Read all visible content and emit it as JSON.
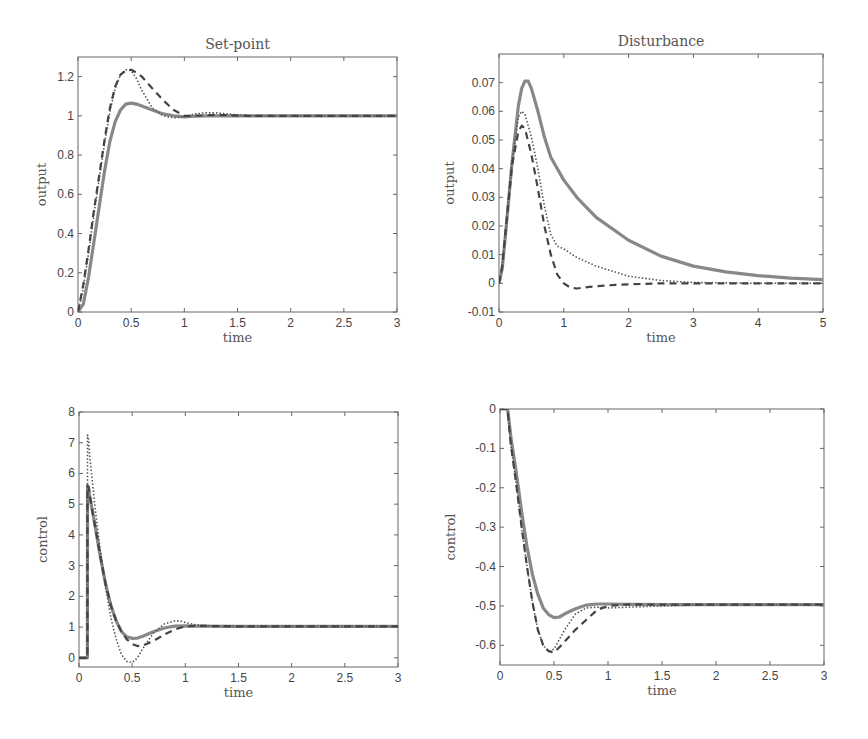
{
  "chart_data": [
    {
      "id": "setpoint-output",
      "type": "line",
      "title": "Set-point",
      "xlabel": "time",
      "ylabel": "output",
      "xlim": [
        0,
        3
      ],
      "ylim": [
        0,
        1.3
      ],
      "xticks": [
        0,
        0.5,
        1,
        1.5,
        2,
        2.5,
        3
      ],
      "xtick_labels": [
        "0",
        "0.5",
        "1",
        "1.5",
        "2",
        "2.5",
        "3"
      ],
      "yticks": [
        0,
        0.2,
        0.4,
        0.6,
        0.8,
        1.0,
        1.2
      ],
      "ytick_labels": [
        "0",
        "0.2",
        "0.4",
        "0.6",
        "0.8",
        "1",
        "1.2"
      ],
      "grid": false,
      "box": {
        "x": 78,
        "y": 57,
        "w": 319,
        "h": 255
      },
      "series": [
        {
          "name": "solid",
          "style": "solid",
          "x": [
            0,
            0.05,
            0.1,
            0.15,
            0.2,
            0.25,
            0.3,
            0.35,
            0.4,
            0.45,
            0.5,
            0.55,
            0.6,
            0.7,
            0.8,
            0.9,
            1.0,
            1.1,
            1.2,
            1.5,
            2,
            2.5,
            3
          ],
          "y": [
            0,
            0.04,
            0.18,
            0.36,
            0.54,
            0.72,
            0.87,
            0.97,
            1.03,
            1.06,
            1.065,
            1.06,
            1.05,
            1.03,
            1.01,
            1.0,
            0.995,
            0.998,
            1.0,
            1.0,
            1.0,
            1.0,
            1.0
          ]
        },
        {
          "name": "dotted",
          "style": "dotted",
          "x": [
            0,
            0.05,
            0.1,
            0.15,
            0.2,
            0.25,
            0.3,
            0.35,
            0.4,
            0.45,
            0.5,
            0.55,
            0.6,
            0.7,
            0.8,
            0.9,
            1.0,
            1.1,
            1.2,
            1.3,
            1.4,
            1.6,
            2,
            2.5,
            3
          ],
          "y": [
            0,
            0.12,
            0.3,
            0.5,
            0.68,
            0.86,
            1.02,
            1.14,
            1.21,
            1.235,
            1.23,
            1.19,
            1.13,
            1.04,
            1.0,
            0.99,
            0.995,
            1.01,
            1.015,
            1.015,
            1.01,
            1.0,
            1.0,
            1.0,
            1.0
          ]
        },
        {
          "name": "dashed",
          "style": "dashed",
          "x": [
            0,
            0.05,
            0.1,
            0.15,
            0.2,
            0.25,
            0.3,
            0.35,
            0.4,
            0.45,
            0.5,
            0.55,
            0.6,
            0.7,
            0.8,
            0.9,
            1.0,
            1.1,
            1.3,
            1.6,
            2,
            2.5,
            3
          ],
          "y": [
            0,
            0.14,
            0.32,
            0.52,
            0.7,
            0.88,
            1.04,
            1.15,
            1.21,
            1.23,
            1.235,
            1.22,
            1.2,
            1.14,
            1.08,
            1.03,
            1.0,
            1.0,
            1.005,
            1.0,
            1.0,
            1.0,
            1.0
          ]
        }
      ]
    },
    {
      "id": "disturbance-output",
      "type": "line",
      "title": "Disturbance",
      "xlabel": "time",
      "ylabel": "output",
      "xlim": [
        0,
        5
      ],
      "ylim": [
        -0.01,
        0.08
      ],
      "xticks": [
        0,
        1,
        2,
        3,
        4,
        5
      ],
      "xtick_labels": [
        "0",
        "1",
        "2",
        "3",
        "4",
        "5"
      ],
      "yticks": [
        -0.01,
        0,
        0.01,
        0.02,
        0.03,
        0.04,
        0.05,
        0.06,
        0.07
      ],
      "ytick_labels": [
        "-0.01",
        "0",
        "0.01",
        "0.02",
        "0.03",
        "0.04",
        "0.05",
        "0.06",
        "0.07"
      ],
      "grid": false,
      "box": {
        "x": 499,
        "y": 54,
        "w": 324,
        "h": 258
      },
      "series": [
        {
          "name": "solid",
          "style": "solid",
          "x": [
            0,
            0.05,
            0.1,
            0.2,
            0.3,
            0.35,
            0.4,
            0.45,
            0.5,
            0.6,
            0.7,
            0.8,
            1.0,
            1.2,
            1.5,
            2.0,
            2.5,
            3.0,
            3.5,
            4.0,
            4.5,
            5.0
          ],
          "y": [
            0,
            0.005,
            0.017,
            0.042,
            0.062,
            0.068,
            0.0705,
            0.0705,
            0.068,
            0.06,
            0.051,
            0.044,
            0.036,
            0.03,
            0.023,
            0.015,
            0.0095,
            0.006,
            0.004,
            0.0027,
            0.0018,
            0.0013
          ]
        },
        {
          "name": "dotted",
          "style": "dotted",
          "x": [
            0,
            0.05,
            0.1,
            0.2,
            0.3,
            0.35,
            0.4,
            0.5,
            0.6,
            0.7,
            0.8,
            0.9,
            1.0,
            1.2,
            1.5,
            2.0,
            2.5,
            3.0,
            4.0,
            5.0
          ],
          "y": [
            0,
            0.006,
            0.018,
            0.043,
            0.058,
            0.06,
            0.059,
            0.051,
            0.04,
            0.027,
            0.017,
            0.013,
            0.012,
            0.009,
            0.006,
            0.0025,
            0.001,
            0.0003,
            0.0,
            0.0
          ]
        },
        {
          "name": "dashed",
          "style": "dashed",
          "x": [
            0,
            0.05,
            0.1,
            0.2,
            0.3,
            0.35,
            0.4,
            0.5,
            0.6,
            0.7,
            0.8,
            0.9,
            1.0,
            1.1,
            1.2,
            1.4,
            1.8,
            2.5,
            3.5,
            5.0
          ],
          "y": [
            0,
            0.006,
            0.018,
            0.041,
            0.053,
            0.055,
            0.054,
            0.045,
            0.033,
            0.02,
            0.01,
            0.003,
            0.0,
            -0.0015,
            -0.0018,
            -0.0012,
            -0.0005,
            0.0,
            0.0,
            0.0
          ]
        }
      ]
    },
    {
      "id": "setpoint-control",
      "type": "line",
      "title": "",
      "xlabel": "time",
      "ylabel": "control",
      "xlim": [
        0,
        3
      ],
      "ylim": [
        -0.3,
        8
      ],
      "xticks": [
        0,
        0.5,
        1,
        1.5,
        2,
        2.5,
        3
      ],
      "xtick_labels": [
        "0",
        "0.5",
        "1",
        "1.5",
        "2",
        "2.5",
        "3"
      ],
      "yticks": [
        0,
        1,
        2,
        3,
        4,
        5,
        6,
        7,
        8
      ],
      "ytick_labels": [
        "0",
        "1",
        "2",
        "3",
        "4",
        "5",
        "6",
        "7",
        "8"
      ],
      "grid": false,
      "box": {
        "x": 79,
        "y": 412,
        "w": 319,
        "h": 255
      },
      "series": [
        {
          "name": "solid",
          "style": "solid",
          "x": [
            0,
            0.079,
            0.08,
            0.09,
            0.1,
            0.15,
            0.2,
            0.25,
            0.3,
            0.35,
            0.4,
            0.45,
            0.5,
            0.55,
            0.6,
            0.7,
            0.8,
            0.9,
            1.0,
            1.1,
            1.5,
            2,
            2.5,
            3
          ],
          "y": [
            0,
            0,
            5.6,
            5.55,
            5.3,
            4.3,
            3.3,
            2.4,
            1.7,
            1.2,
            0.85,
            0.68,
            0.63,
            0.64,
            0.7,
            0.85,
            0.97,
            1.03,
            1.04,
            1.03,
            1.02,
            1.02,
            1.02,
            1.02
          ]
        },
        {
          "name": "dotted",
          "style": "dotted",
          "x": [
            0,
            0.079,
            0.08,
            0.09,
            0.1,
            0.15,
            0.2,
            0.25,
            0.3,
            0.35,
            0.4,
            0.45,
            0.5,
            0.55,
            0.6,
            0.7,
            0.8,
            0.9,
            0.95,
            1.0,
            1.1,
            1.3,
            1.5,
            2,
            2.5,
            3
          ],
          "y": [
            0,
            0,
            7.25,
            7.1,
            6.6,
            4.9,
            3.5,
            2.3,
            1.3,
            0.6,
            0.1,
            -0.12,
            -0.15,
            0.0,
            0.3,
            0.8,
            1.1,
            1.2,
            1.2,
            1.15,
            1.07,
            1.02,
            1.02,
            1.02,
            1.02,
            1.02
          ]
        },
        {
          "name": "dashed",
          "style": "dashed",
          "x": [
            0,
            0.079,
            0.08,
            0.09,
            0.1,
            0.15,
            0.2,
            0.25,
            0.3,
            0.35,
            0.4,
            0.45,
            0.5,
            0.55,
            0.6,
            0.7,
            0.8,
            0.9,
            1.0,
            1.1,
            1.5,
            2,
            2.5,
            3
          ],
          "y": [
            0,
            0,
            5.6,
            5.55,
            5.3,
            4.3,
            3.3,
            2.4,
            1.7,
            1.2,
            0.85,
            0.6,
            0.45,
            0.38,
            0.4,
            0.55,
            0.75,
            0.92,
            1.02,
            1.04,
            1.02,
            1.02,
            1.02,
            1.02
          ]
        }
      ]
    },
    {
      "id": "disturbance-control",
      "type": "line",
      "title": "",
      "xlabel": "time",
      "ylabel": "control",
      "xlim": [
        0,
        3
      ],
      "ylim": [
        -0.65,
        0
      ],
      "xticks": [
        0,
        0.5,
        1,
        1.5,
        2,
        2.5,
        3
      ],
      "xtick_labels": [
        "0",
        "0.5",
        "1",
        "1.5",
        "2",
        "2.5",
        "3"
      ],
      "yticks": [
        -0.6,
        -0.5,
        -0.4,
        -0.3,
        -0.2,
        -0.1,
        0
      ],
      "ytick_labels": [
        "-0.6",
        "-0.5",
        "-0.4",
        "-0.3",
        "-0.2",
        "-0.1",
        "0"
      ],
      "grid": false,
      "box": {
        "x": 500,
        "y": 409,
        "w": 324,
        "h": 256
      },
      "series": [
        {
          "name": "solid",
          "style": "solid",
          "x": [
            0,
            0.07,
            0.08,
            0.1,
            0.15,
            0.2,
            0.25,
            0.3,
            0.35,
            0.4,
            0.45,
            0.5,
            0.55,
            0.6,
            0.7,
            0.8,
            0.9,
            1.0,
            1.2,
            1.5,
            2,
            2.5,
            3
          ],
          "y": [
            0,
            0,
            -0.02,
            -0.07,
            -0.16,
            -0.26,
            -0.35,
            -0.42,
            -0.47,
            -0.505,
            -0.522,
            -0.53,
            -0.528,
            -0.52,
            -0.507,
            -0.498,
            -0.495,
            -0.495,
            -0.496,
            -0.497,
            -0.497,
            -0.497,
            -0.497
          ]
        },
        {
          "name": "dotted",
          "style": "dotted",
          "x": [
            0,
            0.07,
            0.08,
            0.1,
            0.15,
            0.2,
            0.25,
            0.3,
            0.35,
            0.4,
            0.45,
            0.5,
            0.55,
            0.6,
            0.7,
            0.8,
            0.9,
            1.0,
            1.2,
            1.5,
            2,
            2.5,
            3
          ],
          "y": [
            0,
            0,
            -0.03,
            -0.09,
            -0.19,
            -0.3,
            -0.4,
            -0.49,
            -0.56,
            -0.6,
            -0.615,
            -0.61,
            -0.585,
            -0.56,
            -0.52,
            -0.505,
            -0.503,
            -0.505,
            -0.503,
            -0.5,
            -0.497,
            -0.497,
            -0.497
          ]
        },
        {
          "name": "dashed",
          "style": "dashed",
          "x": [
            0,
            0.07,
            0.08,
            0.1,
            0.15,
            0.2,
            0.25,
            0.3,
            0.35,
            0.4,
            0.45,
            0.5,
            0.55,
            0.6,
            0.7,
            0.8,
            0.9,
            1.0,
            1.2,
            1.5,
            2,
            2.5,
            3
          ],
          "y": [
            0,
            0,
            -0.03,
            -0.09,
            -0.19,
            -0.3,
            -0.4,
            -0.49,
            -0.56,
            -0.6,
            -0.615,
            -0.618,
            -0.605,
            -0.59,
            -0.56,
            -0.535,
            -0.51,
            -0.5,
            -0.496,
            -0.497,
            -0.497,
            -0.497,
            -0.497
          ]
        }
      ]
    }
  ],
  "style": {
    "solid_color": "#888888",
    "dotted_color": "#555555",
    "dashed_color": "#444444",
    "axis_color": "#666666"
  }
}
